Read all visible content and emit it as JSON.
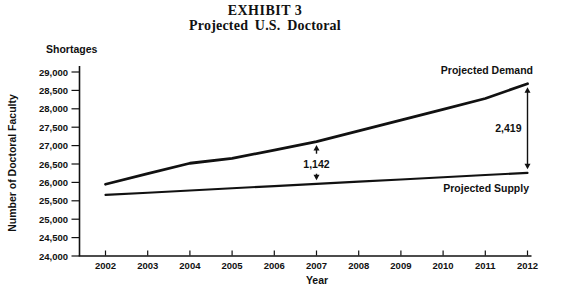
{
  "chart_data": {
    "type": "line",
    "title": "EXHIBIT 3",
    "subtitle": "Projected U.S. Doctoral",
    "top_left_label": "Shortages",
    "xlabel": "Year",
    "ylabel": "Number of Doctoral Faculty",
    "x": [
      2002,
      2003,
      2004,
      2005,
      2006,
      2007,
      2008,
      2009,
      2010,
      2011,
      2012
    ],
    "xtick_labels": [
      "2002",
      "2003",
      "2004",
      "2005",
      "2006",
      "2007",
      "2008",
      "2009",
      "2010",
      "2011",
      "2012"
    ],
    "ylim": [
      24000,
      29000
    ],
    "ytick_step": 500,
    "ytick_labels": [
      "29,000",
      "28,500",
      "28,000",
      "27,500",
      "27,000",
      "26,500",
      "26,000",
      "25,500",
      "25,000",
      "24,500",
      "24,000"
    ],
    "grid": false,
    "legend_position": "inline-labels-near-lines",
    "series": [
      {
        "name": "Projected Demand",
        "values": [
          25950,
          26240,
          26520,
          26650,
          26880,
          27110,
          27400,
          27695,
          27985,
          28280,
          28680
        ],
        "width": 2.8
      },
      {
        "name": "Projected Supply",
        "values": [
          25660,
          25720,
          25780,
          25840,
          25900,
          25960,
          26020,
          26080,
          26140,
          26200,
          26260
        ],
        "width": 2.1
      }
    ],
    "annotations": [
      {
        "label": "1,142",
        "year": 2007,
        "text_position": "between"
      },
      {
        "label": "2,419",
        "year": 2012,
        "text_position": "left"
      }
    ],
    "colors": {
      "line": "#111111",
      "text": "#111111",
      "background": "#ffffff"
    }
  }
}
